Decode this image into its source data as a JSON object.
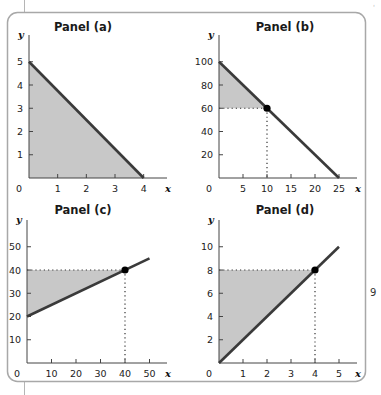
{
  "colors": {
    "line": "#3a3a3a",
    "fill": "#c8c8c8",
    "axis": "#444444",
    "frame": "#a8a8a8",
    "point": "#000000"
  },
  "chart_data": [
    {
      "type": "line",
      "title": "Panel (a)",
      "xlabel": "x",
      "ylabel": "y",
      "origin_label": "0",
      "x_ticks": [
        1,
        2,
        3,
        4
      ],
      "y_ticks": [
        1,
        2,
        3,
        4,
        5
      ],
      "xlim": [
        0,
        4.8
      ],
      "ylim": [
        0,
        6
      ],
      "series": [
        {
          "name": "line",
          "x": [
            0,
            4
          ],
          "y": [
            5,
            0
          ]
        }
      ],
      "shaded_region": {
        "vertices": [
          [
            0,
            0
          ],
          [
            0,
            5
          ],
          [
            4,
            0
          ]
        ]
      },
      "grid": false
    },
    {
      "type": "line",
      "title": "Panel (b)",
      "xlabel": "x",
      "ylabel": "y",
      "origin_label": "0",
      "x_ticks": [
        5,
        10,
        15,
        20,
        25
      ],
      "y_ticks": [
        20,
        40,
        60,
        80,
        100
      ],
      "xlim": [
        0,
        28
      ],
      "ylim": [
        0,
        120
      ],
      "series": [
        {
          "name": "line",
          "x": [
            0,
            25
          ],
          "y": [
            100,
            0
          ]
        }
      ],
      "point": {
        "x": 10,
        "y": 60
      },
      "shaded_region": {
        "vertices": [
          [
            0,
            60
          ],
          [
            0,
            100
          ],
          [
            10,
            60
          ]
        ]
      },
      "dotted_guides": true,
      "grid": false
    },
    {
      "type": "line",
      "title": "Panel (c)",
      "xlabel": "x",
      "ylabel": "y",
      "origin_label": "0",
      "x_ticks": [
        10,
        20,
        30,
        40,
        50
      ],
      "y_ticks": [
        10,
        20,
        30,
        40,
        50
      ],
      "xlim": [
        0,
        57
      ],
      "ylim": [
        0,
        60
      ],
      "series": [
        {
          "name": "line",
          "x": [
            0,
            50
          ],
          "y": [
            20,
            45
          ]
        }
      ],
      "point": {
        "x": 40,
        "y": 40
      },
      "shaded_region": {
        "vertices": [
          [
            0,
            20
          ],
          [
            0,
            40
          ],
          [
            40,
            40
          ]
        ]
      },
      "dotted_guides": true,
      "grid": false
    },
    {
      "type": "line",
      "title": "Panel (d)",
      "xlabel": "x",
      "ylabel": "y",
      "origin_label": "0",
      "x_ticks": [
        1,
        2,
        3,
        4,
        5
      ],
      "y_ticks": [
        2,
        4,
        6,
        8,
        10
      ],
      "xlim": [
        0,
        5.6
      ],
      "ylim": [
        0,
        12
      ],
      "series": [
        {
          "name": "line",
          "x": [
            0,
            5
          ],
          "y": [
            0,
            10
          ]
        }
      ],
      "point": {
        "x": 4,
        "y": 8
      },
      "shaded_region": {
        "vertices": [
          [
            0,
            0
          ],
          [
            0,
            8
          ],
          [
            4,
            8
          ]
        ]
      },
      "dotted_guides": true,
      "grid": false
    }
  ]
}
